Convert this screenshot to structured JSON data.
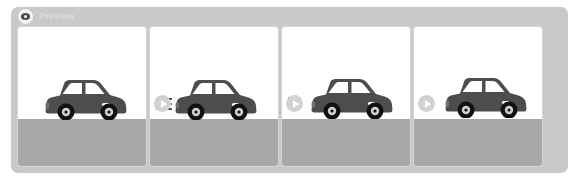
{
  "panel": {
    "title": "Preview",
    "icon": "eye-icon",
    "background_color": "#c9c9c9",
    "title_color": "#dcdcdc"
  },
  "frames": [
    {
      "index": 1,
      "name": "frame-1",
      "car_label": "car",
      "car_color": "#4d4d4d",
      "car_left": 26,
      "car_top": 52,
      "road_color": "#a8a8a8",
      "motion_dashes": []
    },
    {
      "index": 2,
      "name": "frame-2",
      "car_label": "car",
      "car_color": "#4d4d4d",
      "car_left": 24,
      "car_top": 52,
      "road_color": "#a8a8a8",
      "motion_dashes": [
        16,
        16,
        16
      ]
    },
    {
      "index": 3,
      "name": "frame-3",
      "car_label": "car",
      "car_color": "#4d4d4d",
      "car_left": 28,
      "car_top": 51,
      "road_color": "#a8a8a8",
      "motion_dashes": [
        6,
        6
      ]
    },
    {
      "index": 4,
      "name": "frame-4",
      "car_label": "car",
      "car_color": "#4d4d4d",
      "car_left": 30,
      "car_top": 50,
      "road_color": "#a8a8a8",
      "motion_dashes": []
    }
  ],
  "arrows": [
    {
      "name": "frame-transition-arrow-1",
      "glyph": "chevron-right",
      "left": 143,
      "top": 88
    },
    {
      "name": "frame-transition-arrow-2",
      "glyph": "chevron-right",
      "left": 275,
      "top": 88
    },
    {
      "name": "frame-transition-arrow-3",
      "glyph": "chevron-right",
      "left": 407,
      "top": 88
    }
  ],
  "colors": {
    "panel_bg": "#c9c9c9",
    "frame_bg": "#ffffff",
    "frame_border": "#d6d6d6",
    "road": "#a8a8a8",
    "car_body": "#4d4d4d",
    "wheel": "#111111",
    "hubcap": "#cfcfcf",
    "arrow_circle": "#d2d2d2",
    "arrow_glyph": "#ffffff"
  }
}
